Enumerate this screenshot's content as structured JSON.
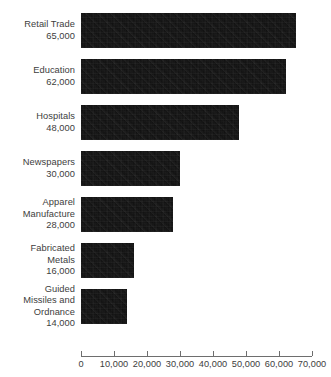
{
  "chart_data": {
    "type": "bar",
    "orientation": "horizontal",
    "title": "",
    "subtitle": "",
    "xlabel": "",
    "ylabel": "",
    "grid": false,
    "legend": null,
    "xlim": [
      0,
      70000
    ],
    "xticks": [
      0,
      10000,
      20000,
      30000,
      40000,
      50000,
      60000,
      70000
    ],
    "xtick_labels": [
      "0",
      "10,000",
      "20,000",
      "30,000",
      "40,000",
      "50,000",
      "60,000",
      "70,000"
    ],
    "categories": [
      "Retail Trade",
      "Education",
      "Hospitals",
      "Newspapers",
      "Apparel Manufacture",
      "Fabricated Metals",
      "Guided Missiles and Ordnance"
    ],
    "values": [
      65000,
      62000,
      48000,
      30000,
      28000,
      16000,
      14000
    ],
    "value_labels": [
      "65,000",
      "62,000",
      "48,000",
      "30,000",
      "28,000",
      "16,000",
      "14,000"
    ],
    "bar_color": "#0d0d0d",
    "axis_color": "#6e6e6e",
    "text_color": "#3d3d3d"
  },
  "bars": [
    {
      "name_lines": "Retail Trade",
      "value_label": "65,000",
      "value": 65000,
      "label_block": "Retail Trade\n65,000"
    },
    {
      "name_lines": "Education",
      "value_label": "62,000",
      "value": 62000,
      "label_block": "Education\n62,000"
    },
    {
      "name_lines": "Hospitals",
      "value_label": "48,000",
      "value": 48000,
      "label_block": "Hospitals\n48,000"
    },
    {
      "name_lines": "Newspapers",
      "value_label": "30,000",
      "value": 30000,
      "label_block": "Newspapers\n30,000"
    },
    {
      "name_lines": "Apparel\nManufacture",
      "value_label": "28,000",
      "value": 28000,
      "label_block": "Apparel\nManufacture\n28,000"
    },
    {
      "name_lines": "Fabricated\nMetals",
      "value_label": "16,000",
      "value": 16000,
      "label_block": "Fabricated\nMetals\n16,000"
    },
    {
      "name_lines": "Guided\nMissiles and\nOrdnance",
      "value_label": "14,000",
      "value": 14000,
      "label_block": "Guided\nMissiles and\nOrdnance\n14,000"
    }
  ],
  "axis": {
    "ticks": [
      {
        "value": 0,
        "label": "0"
      },
      {
        "value": 10000,
        "label": "10,000"
      },
      {
        "value": 20000,
        "label": "20,000"
      },
      {
        "value": 30000,
        "label": "30,000"
      },
      {
        "value": 40000,
        "label": "40,000"
      },
      {
        "value": 50000,
        "label": "50,000"
      },
      {
        "value": 60000,
        "label": "60,000"
      },
      {
        "value": 70000,
        "label": "70,000"
      }
    ]
  }
}
